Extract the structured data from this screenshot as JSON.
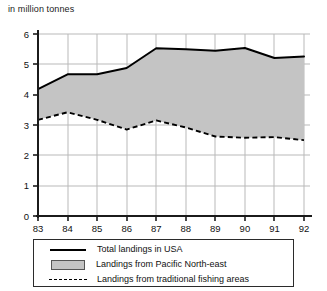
{
  "chart": {
    "subtitle": "in million tonnes"
  },
  "legend": {
    "items": [
      {
        "label": "Total landings in USA",
        "marker": "solid-line",
        "color": "#000000"
      },
      {
        "label": "Landings from Pacific North-east",
        "marker": "filled-swatch",
        "color": "#c4c4c4"
      },
      {
        "label": "Landings from traditional fishing areas",
        "marker": "dashed-line",
        "color": "#000000"
      }
    ]
  },
  "chart_data": {
    "type": "area",
    "title": "",
    "subtitle": "in million tonnes",
    "xlabel": "",
    "ylabel": "in million tonnes",
    "categories": [
      "83",
      "84",
      "85",
      "86",
      "87",
      "88",
      "89",
      "90",
      "91",
      "92"
    ],
    "x": [
      83,
      84,
      85,
      86,
      87,
      88,
      89,
      90,
      91,
      92
    ],
    "ylim": [
      0,
      6
    ],
    "yticks": [
      0,
      1,
      2,
      3,
      4,
      5,
      6
    ],
    "xlim": [
      83,
      92
    ],
    "grid": true,
    "legend_position": "bottom",
    "series": [
      {
        "name": "Total landings in USA",
        "type": "line",
        "style": "solid",
        "color": "#000000",
        "values": [
          4.18,
          4.67,
          4.67,
          4.88,
          5.53,
          5.5,
          5.45,
          5.54,
          5.21,
          5.26
        ]
      },
      {
        "name": "Landings from traditional fishing areas",
        "type": "line",
        "style": "dashed",
        "color": "#000000",
        "values": [
          3.17,
          3.42,
          3.17,
          2.85,
          3.15,
          2.92,
          2.62,
          2.58,
          2.6,
          2.5
        ]
      },
      {
        "name": "Landings from Pacific North-east",
        "type": "band",
        "style": "filled",
        "color": "#c4c4c4",
        "note": "shaded area between total landings and traditional fishing areas",
        "values": [
          1.01,
          1.25,
          1.5,
          2.03,
          2.38,
          2.58,
          2.83,
          2.96,
          2.61,
          2.76
        ]
      }
    ]
  }
}
